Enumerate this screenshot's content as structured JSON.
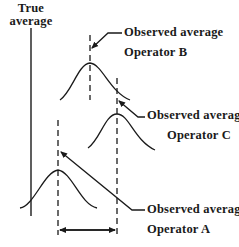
{
  "diagram": {
    "true_average": {
      "line1": "True",
      "line2": "average"
    },
    "operators": [
      {
        "name": "Operator B",
        "label_line1": "Observed average",
        "label_line2": "Operator B"
      },
      {
        "name": "Operator C",
        "label_line1": "Observed average",
        "label_line2": "Operator C"
      },
      {
        "name": "Operator A",
        "label_line1": "Observed average",
        "label_line2": "Operator A"
      }
    ],
    "colors": {
      "line": "#1a1a1a",
      "background": "#ffffff"
    }
  }
}
